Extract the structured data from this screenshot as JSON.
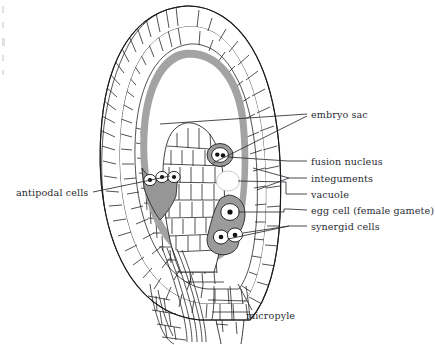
{
  "figure": {
    "kind": "botanical-diagram",
    "background_color": "#ffffff",
    "ink_color": "#1a1a1a",
    "tissue_fill": "#ffffff",
    "embryo_sac_lining_color": "#a6a6a6",
    "cell_mass_gray": "#9b9b9b",
    "nucleus_color": "#111111"
  },
  "labels": [
    {
      "id": "embryo-sac",
      "text": "embryo sac",
      "x": 311,
      "y": 117
    },
    {
      "id": "fusion-nucleus",
      "text": "fusion nucleus",
      "x": 311,
      "y": 164
    },
    {
      "id": "integuments",
      "text": "integuments",
      "x": 311,
      "y": 181
    },
    {
      "id": "vacuole",
      "text": "vacuole",
      "x": 311,
      "y": 197
    },
    {
      "id": "egg-cell",
      "text": "egg cell (female gamete)",
      "x": 311,
      "y": 213
    },
    {
      "id": "synergid-cells",
      "text": "synergid cells",
      "x": 311,
      "y": 229
    },
    {
      "id": "antipodal-cells",
      "text": "antipodal cells",
      "x": 16,
      "y": 194
    },
    {
      "id": "micropyle",
      "text": "micropyle",
      "x": 246,
      "y": 317
    }
  ],
  "structures": {
    "antipodal_cells_count": 3,
    "synergid_cells_count": 2,
    "fusion_nucleus_dots": 2,
    "egg_cell_nuclei": 1,
    "integument_layers": 2
  }
}
